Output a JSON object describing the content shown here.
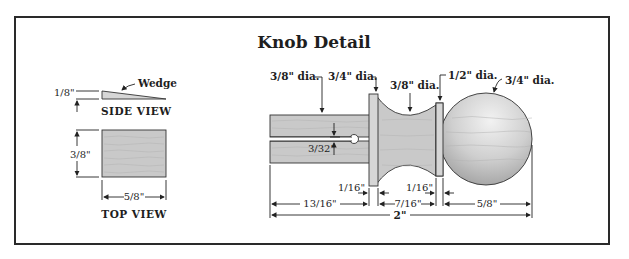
{
  "title": "Knob Detail",
  "wedge": {
    "label": "Wedge",
    "side_view": {
      "caption": "SIDE VIEW",
      "thickness": "1/8\""
    },
    "top_view": {
      "caption": "TOP VIEW",
      "height": "3/8\"",
      "width": "5/8\""
    }
  },
  "knob": {
    "diameters": [
      {
        "label": "3/8\" dia.",
        "target": "tenon"
      },
      {
        "label": "3/4\" dia.",
        "target": "collar"
      },
      {
        "label": "3/8\" dia.",
        "target": "cove"
      },
      {
        "label": "1/2\" dia.",
        "target": "bead"
      },
      {
        "label": "3/4\" dia.",
        "target": "ball"
      }
    ],
    "slot_width": "3/32\"",
    "dimensions": {
      "collar_width": "1/16\"",
      "bead_width": "1/16\"",
      "tenon_length": "13/16\"",
      "cove_length": "7/16\"",
      "ball_length": "5/8\"",
      "overall_length": "2\""
    }
  },
  "colors": {
    "frame": "#2a2a2a",
    "wood": "#c9c9c9",
    "line": "#222222"
  }
}
